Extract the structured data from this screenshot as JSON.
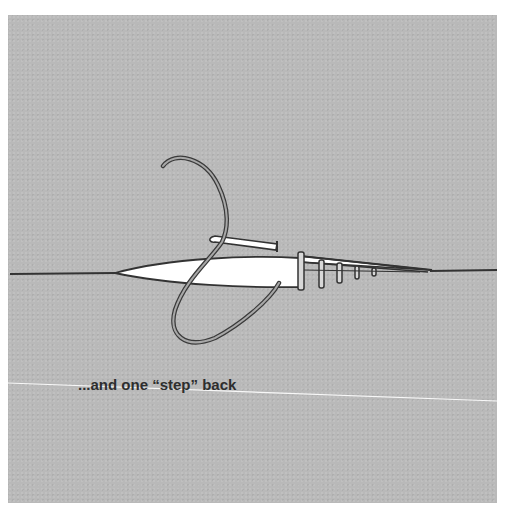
{
  "illustration": {
    "subject": "embroidery stitch step: needle with thread taking one step back",
    "caption": "...and one “step” back",
    "colors": {
      "background": "#b9b9b9",
      "line": "#3a3a3a",
      "fill": "#ffffff",
      "crease": "#ffffff"
    }
  }
}
